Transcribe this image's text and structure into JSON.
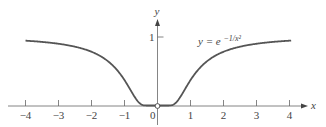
{
  "chart_data": {
    "type": "line",
    "title": "",
    "xlabel": "x",
    "ylabel": "y",
    "xlim": [
      -4.1,
      4.1
    ],
    "ylim": [
      0,
      1
    ],
    "grid": false,
    "x_ticks": [
      -4,
      -3,
      -2,
      -1,
      0,
      1,
      2,
      3,
      4
    ],
    "x_tick_labels": [
      "−4",
      "−3",
      "−2",
      "−1",
      "0",
      "1",
      "2",
      "3",
      "4"
    ],
    "y_ticks": [
      1
    ],
    "y_tick_labels": [
      "1"
    ],
    "series": [
      {
        "name": "y = e^(-1/x^2)",
        "function": "exp(-1/x^2)",
        "x": [
          -4,
          -3,
          -2,
          -1.5,
          -1,
          -0.75,
          -0.5,
          -0.25,
          0,
          0.25,
          0.5,
          0.75,
          1,
          1.5,
          2,
          3,
          4
        ],
        "values": [
          0.939,
          0.895,
          0.779,
          0.641,
          0.368,
          0.169,
          0.018,
          0.0,
          0.0,
          0.0,
          0.018,
          0.169,
          0.368,
          0.641,
          0.779,
          0.895,
          0.939
        ]
      }
    ],
    "annotations": [
      {
        "text_main": "y = e",
        "text_sup": "−1/x²",
        "near_x": 1.2,
        "near_y": 0.9
      },
      {
        "type": "open-circle",
        "x": 0,
        "y": 0
      }
    ],
    "colors": {
      "curve": "#555555",
      "axes": "#666666"
    }
  }
}
